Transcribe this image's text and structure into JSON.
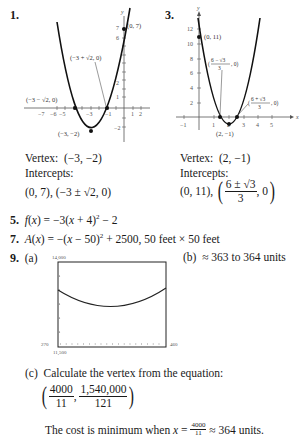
{
  "problems": {
    "p1": {
      "number": "1.",
      "graph": {
        "y_axis_label": "y",
        "x_ticks": [
          "−7",
          "−6",
          "−5",
          "−3",
          "−1",
          "1",
          "2"
        ],
        "y_ticks": [
          "7",
          "6",
          "2",
          "1",
          "−2"
        ],
        "point_labels": {
          "y_intercept": "(0, 7)",
          "right_root": "(−3 + √2, 0)",
          "left_root": "(−3 − √2, 0)",
          "vertex": "(−3, −2)"
        }
      },
      "vertex_label": "Vertex:",
      "vertex_value": "(−3, −2)",
      "intercepts_label": "Intercepts:",
      "intercepts_value": "(0, 7), (−3 ± √2, 0)"
    },
    "p3": {
      "number": "3.",
      "graph": {
        "y_axis_label": "y",
        "x_axis_label": "x",
        "x_ticks": [
          "−1",
          "1",
          "2",
          "3",
          "4",
          "5"
        ],
        "y_ticks": [
          "12",
          "10",
          "8",
          "6",
          "4",
          "2"
        ],
        "point_labels": {
          "y_intercept": "(0, 11)",
          "left_root_num": "6 − √3",
          "left_root_den": "3",
          "right_root_num": "6 + √3",
          "right_root_den": "3",
          "vertex": "(2, −1)"
        }
      },
      "vertex_label": "Vertex:",
      "vertex_value": "(2, −1)",
      "intercepts_label": "Intercepts:",
      "intercepts_prefix": "(0, 11),",
      "intercepts_frac_num": "6 ± √3",
      "intercepts_frac_den": "3",
      "intercepts_suffix": ", 0"
    },
    "p5": {
      "number": "5.",
      "fname": "f",
      "var": "x",
      "expr_a": ") = −3(",
      "expr_b": " + 4)",
      "exp": "2",
      "expr_c": " − 2"
    },
    "p7": {
      "number": "7.",
      "fname": "A",
      "var": "x",
      "expr_a": ") = −(",
      "expr_b": " − 50)",
      "exp": "2",
      "expr_c": " + 2500,  50 feet × 50 feet"
    },
    "p9": {
      "number": "9.",
      "part_a": "(a)",
      "graph": {
        "y_max": "14,000",
        "y_min": "11,500",
        "x_min": "270",
        "x_max": "460"
      },
      "part_b": "(b)",
      "part_b_text": "≈ 363 to 364 units",
      "part_c": "(c)",
      "part_c_text": "Calculate the vertex from the equation:",
      "vertex_x_num": "4000",
      "vertex_x_den": "11",
      "vertex_y_num": "1,540,000",
      "vertex_y_den": "121",
      "conclusion_a": "The cost is minimum when ",
      "conclusion_var": "x",
      "conclusion_eq": " = ",
      "conclusion_frac_num": "4000",
      "conclusion_frac_den": "11",
      "conclusion_b": " ≈ 364 units."
    }
  }
}
